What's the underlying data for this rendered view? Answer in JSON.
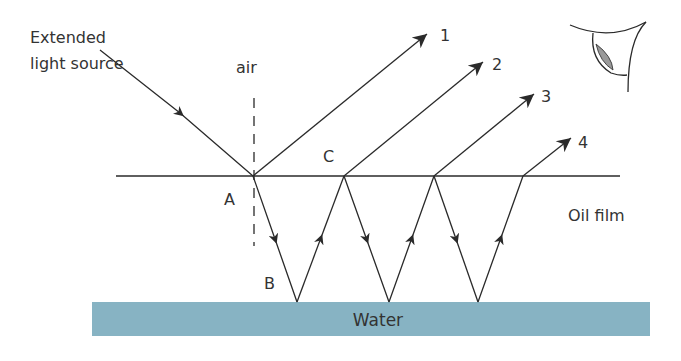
{
  "diagram": {
    "labels": {
      "source": [
        "Extended",
        "light source"
      ],
      "air": "air",
      "point_a": "A",
      "point_b": "B",
      "point_c": "C",
      "oil": "Oil film",
      "water": "Water"
    },
    "rays": [
      {
        "id": "1",
        "label": "1"
      },
      {
        "id": "2",
        "label": "2"
      },
      {
        "id": "3",
        "label": "3"
      },
      {
        "id": "4",
        "label": "4"
      }
    ],
    "colors": {
      "line": "#2a2a2a",
      "water": "#87b3c3",
      "eye_pupil": "#9a9a9a"
    },
    "icons": [
      "eye-icon"
    ]
  }
}
